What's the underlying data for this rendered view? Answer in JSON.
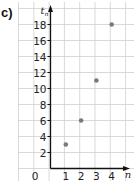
{
  "panel_label": "c)",
  "colors": {
    "grid": "#cfcfcf",
    "axis": "#111111",
    "point": "#7a7a7a",
    "text": "#222222"
  },
  "chart_data": {
    "type": "scatter",
    "title": "",
    "xlabel": "n",
    "ylabel": "t_n",
    "x": [
      1,
      2,
      3,
      4
    ],
    "values": [
      3,
      6,
      11,
      18
    ],
    "points": [
      {
        "x": 1,
        "y": 3
      },
      {
        "x": 2,
        "y": 6
      },
      {
        "x": 3,
        "y": 11
      },
      {
        "x": 4,
        "y": 18
      }
    ],
    "xticks": [
      "1",
      "2",
      "3",
      "4"
    ],
    "yticks": [
      "2",
      "4",
      "6",
      "8",
      "10",
      "12",
      "14",
      "16",
      "18"
    ],
    "origin_label": "0",
    "xlim": [
      0,
      4.5
    ],
    "ylim": [
      0,
      19
    ],
    "grid": true,
    "legend": null
  }
}
